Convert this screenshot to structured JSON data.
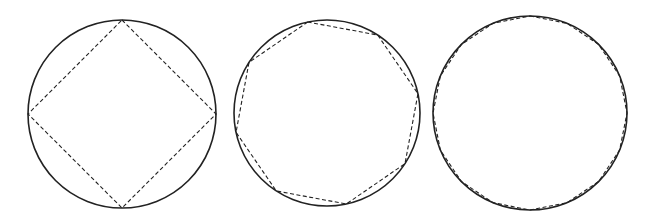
{
  "figure": {
    "colors": {
      "stroke": "#222222",
      "background": "#ffffff"
    },
    "panels": [
      {
        "name": "square-in-circle",
        "sides": 4,
        "cx": 122,
        "cy": 114,
        "r": 94,
        "rotation_deg": 0
      },
      {
        "name": "octagon-in-circle",
        "sides": 8,
        "cx": 327,
        "cy": 113,
        "r": 93,
        "rotation_deg": -12
      },
      {
        "name": "hexadecagon-in-circle",
        "sides": 16,
        "cx": 530,
        "cy": 113,
        "r": 97,
        "rotation_deg": 0
      }
    ]
  }
}
